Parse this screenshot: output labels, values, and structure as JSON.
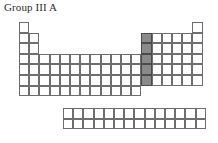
{
  "title": "Group III A",
  "colors": {
    "cell_border": "#6e6e6e",
    "highlight_fill": "#8a8a8a",
    "highlight_border": "#4a4a4a",
    "background": "#ffffff",
    "text": "#2b2b2b"
  },
  "diagram": {
    "type": "periodic-table-outline",
    "cell_width": 10.2,
    "cell_height": 10.6,
    "main_block": {
      "origin_x": 19,
      "origin_y": 22,
      "columns": 18,
      "rows": 7,
      "row_spans": [
        {
          "row": 1,
          "segments": [
            [
              1,
              1
            ],
            [
              18,
              18
            ]
          ]
        },
        {
          "row": 2,
          "segments": [
            [
              1,
              2
            ],
            [
              13,
              18
            ]
          ]
        },
        {
          "row": 3,
          "segments": [
            [
              1,
              2
            ],
            [
              13,
              18
            ]
          ]
        },
        {
          "row": 4,
          "segments": [
            [
              1,
              18
            ]
          ]
        },
        {
          "row": 5,
          "segments": [
            [
              1,
              18
            ]
          ]
        },
        {
          "row": 6,
          "segments": [
            [
              1,
              18
            ]
          ]
        },
        {
          "row": 7,
          "segments": [
            [
              1,
              12
            ]
          ]
        }
      ]
    },
    "f_block": {
      "origin_x": 63,
      "origin_y": 108,
      "columns": 14,
      "rows": 2
    },
    "highlight": {
      "label": "Group III A",
      "column": 13,
      "rows": [
        2,
        3,
        4,
        5,
        6
      ]
    }
  }
}
